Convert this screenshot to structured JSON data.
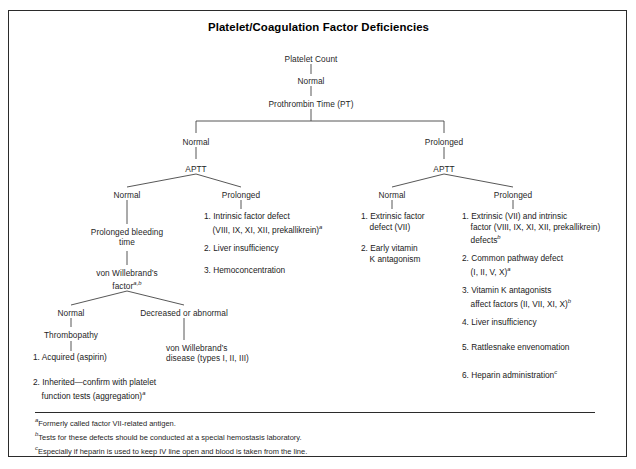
{
  "figure": {
    "title": "Platelet/Coagulation Factor Deficiencies",
    "border_color": "#2b2b2b",
    "text_color": "#1f1f1f",
    "background": "#ffffff"
  },
  "flow": {
    "root": "Platelet Count",
    "root_result": "Normal",
    "level2": "Prothrombin Time (PT)",
    "pt_normal": "Normal",
    "pt_prolonged": "Prolonged",
    "aptt_left": "APTT",
    "aptt_right": "APTT",
    "aptt_left_normal": "Normal",
    "aptt_left_prolonged": "Prolonged",
    "aptt_right_normal": "Normal",
    "aptt_right_prolonged": "Prolonged",
    "bleeding_time": "Prolonged bleeding\ntime",
    "vwf_label_line1": "von Willebrand’s",
    "vwf_label_line2": "factor",
    "vwf_label_sup": "a,b",
    "vwf_normal": "Normal",
    "vwf_abnormal": "Decreased or abnormal",
    "thrombopathy": "Thrombopathy",
    "vwd_disease": "von Willebrand’s\ndisease (types I, II, III)"
  },
  "lists": {
    "thrombopathy_items": [
      "1. Acquired (aspirin)",
      "2. Inherited—confirm with platelet\n    function tests (aggregation)"
    ],
    "thrombopathy_item2_sup": "a",
    "aptt_left_prolonged_items": [
      "1. Intrinsic factor defect\n    (VIII, IX, XI, XII, prekallikrein)",
      "2. Liver insufficiency",
      "3. Hemoconcentration"
    ],
    "aptt_left_prolonged_item1_sup": "a",
    "aptt_right_normal_items": [
      "1. Extrinsic factor\n    defect (VII)",
      "2. Early vitamin\n    K antagonism"
    ],
    "aptt_right_prolonged_items": [
      "1. Extrinsic (VII) and intrinsic\n    factor (VIII, IX, XI, XII, prekallikrein)\n    defects",
      "2. Common pathway defect\n    (I, II, V, X)",
      "3. Vitamin K antagonists\n    affect factors (II, VII, XI, X)",
      "4. Liver insufficiency",
      "5. Rattlesnake envenomation",
      "6. Heparin administration"
    ],
    "aptt_right_prolonged_sups": [
      "b",
      "a",
      "b",
      "",
      "",
      "c"
    ]
  },
  "footnotes": [
    {
      "mark": "a",
      "text": "Formerly called factor VII-related antigen."
    },
    {
      "mark": "b",
      "text": "Tests for these defects should be conducted at a special hemostasis laboratory."
    },
    {
      "mark": "c",
      "text": "Especially if heparin is used to keep IV line open and blood is taken from the line."
    }
  ]
}
